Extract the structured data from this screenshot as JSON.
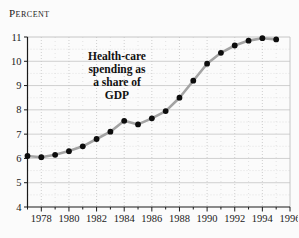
{
  "unit_label": "Percent",
  "annotation": {
    "line1": "Health-care",
    "line2": "spending as",
    "line3": "a share of",
    "line4": "GDP"
  },
  "colors": {
    "axis": "#1a1a1a",
    "frame": "#c0c0c0",
    "grid_major": "#c4c4c4",
    "grid_minor": "#d8d8d8",
    "line": "#a3a3a3",
    "point": "#0d0d0d",
    "text": "#1a1a1a"
  },
  "chart_data": {
    "type": "line",
    "title": "Health-care spending as a share of GDP",
    "ylabel": "Percent",
    "xlabel": "",
    "x": [
      1977,
      1978,
      1979,
      1980,
      1981,
      1982,
      1983,
      1984,
      1985,
      1986,
      1987,
      1988,
      1989,
      1990,
      1991,
      1992,
      1993,
      1994,
      1995
    ],
    "values": [
      6.1,
      6.05,
      6.15,
      6.3,
      6.5,
      6.8,
      7.1,
      7.55,
      7.4,
      7.65,
      7.95,
      8.5,
      9.2,
      9.9,
      10.35,
      10.65,
      10.85,
      10.95,
      10.9
    ],
    "xlim": [
      1977,
      1996
    ],
    "ylim": [
      4,
      11
    ],
    "y_ticks": [
      4,
      5,
      6,
      7,
      8,
      9,
      10,
      11
    ],
    "x_tick_labels": [
      "1978",
      "1980",
      "1982",
      "1984",
      "1986",
      "1988",
      "1990",
      "1992",
      "1994",
      "1996"
    ],
    "grid": "on",
    "legend": "none",
    "marker": "filled-circle",
    "line_style": "thick-gray"
  }
}
